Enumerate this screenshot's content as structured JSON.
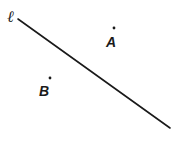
{
  "diagram": {
    "line": {
      "label": "ℓ",
      "x1": 18,
      "y1": 19,
      "x2": 170,
      "y2": 128,
      "color": "#1a1a1a"
    },
    "points": [
      {
        "name": "A",
        "dot": {
          "x": 114,
          "y": 28
        },
        "label_pos": {
          "x": 106,
          "y": 47
        }
      },
      {
        "name": "B",
        "dot": {
          "x": 50,
          "y": 78
        },
        "label_pos": {
          "x": 39,
          "y": 96
        }
      }
    ]
  }
}
